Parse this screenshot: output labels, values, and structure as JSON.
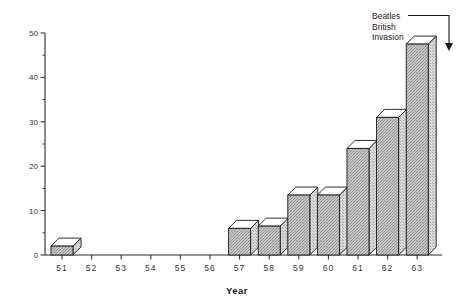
{
  "chart_data": {
    "type": "bar",
    "title": "",
    "subtitle": "",
    "xlabel": "Year",
    "ylabel": "",
    "categories": [
      "51",
      "52",
      "53",
      "54",
      "55",
      "56",
      "57",
      "58",
      "59",
      "60",
      "61",
      "62",
      "63"
    ],
    "values": [
      2,
      0,
      0,
      0,
      0,
      0,
      6,
      6.5,
      13.5,
      13.5,
      24,
      31,
      47.5
    ],
    "series": [
      {
        "name": "",
        "values": [
          2,
          0,
          0,
          0,
          0,
          0,
          6,
          6.5,
          13.5,
          13.5,
          24,
          31,
          47.5
        ]
      }
    ],
    "ylim": [
      0,
      50
    ],
    "yticks": [
      0,
      10,
      20,
      30,
      40,
      50
    ],
    "ytick_labels": [
      "0",
      "10",
      "20",
      "30",
      "40",
      "50"
    ],
    "yminor_ticks": [
      5,
      15,
      25,
      35,
      45
    ],
    "grid": false,
    "legend": null,
    "bar_style": "3d-extruded",
    "bar_fill_color": "#b8b8b8",
    "bar_top_color": "#ffffff",
    "bar_side_color": "#cfcfcf",
    "bar_edge_color": "#1a1a1a",
    "annotations": [
      {
        "name": "beatles-british-invasion",
        "lines": [
          "Beatles",
          "British",
          "Invasion"
        ],
        "points_to_category": "63",
        "arrow_direction": "down"
      }
    ]
  },
  "axis": {
    "x_title": "Year",
    "y_tick_labels": [
      "0",
      "10",
      "20",
      "30",
      "40",
      "50"
    ],
    "x_tick_labels": [
      "51",
      "52",
      "53",
      "54",
      "55",
      "56",
      "57",
      "58",
      "59",
      "60",
      "61",
      "62",
      "63"
    ]
  },
  "annotation": {
    "line1": "Beatles",
    "line2": "British",
    "line3": "Invasion"
  },
  "colors": {
    "bar_fill": "#b8b8b8",
    "bar_top": "#ffffff",
    "bar_side": "#cfcfcf",
    "ink": "#1a1a1a",
    "background": "#ffffff"
  }
}
